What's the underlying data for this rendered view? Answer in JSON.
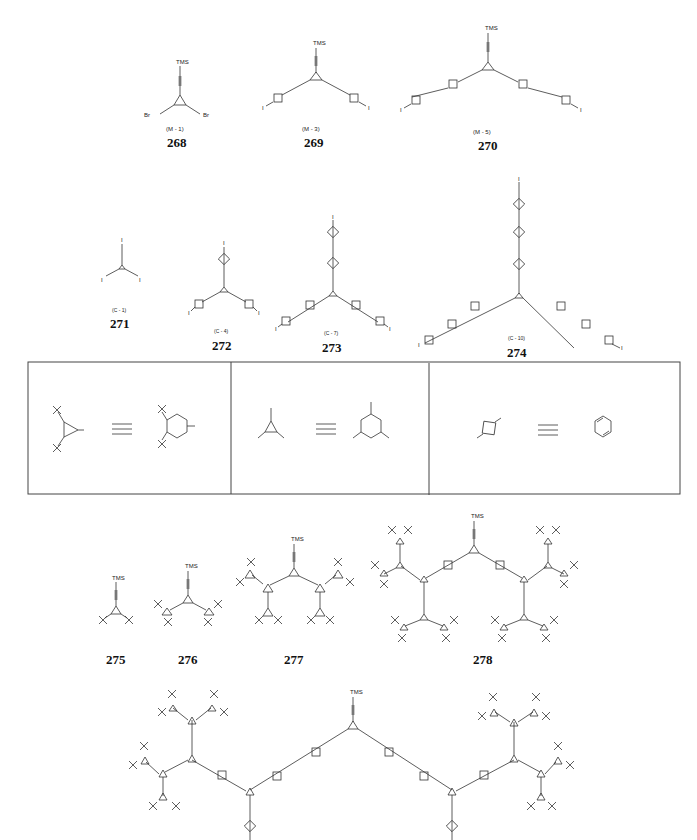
{
  "figure": {
    "row1": [
      {
        "id": "268",
        "code": "(M - 1)",
        "top_label": "TMS",
        "end_labels": [
          "Br",
          "Br"
        ]
      },
      {
        "id": "269",
        "code": "(M - 3)",
        "top_label": "TMS",
        "end_labels": [
          "I",
          "I"
        ]
      },
      {
        "id": "270",
        "code": "(M - 5)",
        "top_label": "TMS",
        "end_labels": [
          "I",
          "I"
        ]
      }
    ],
    "row2": [
      {
        "id": "271",
        "code": "(C - 1)",
        "end_labels": [
          "I",
          "I",
          "I"
        ]
      },
      {
        "id": "272",
        "code": "(C - 4)",
        "end_labels": [
          "I",
          "I",
          "I"
        ]
      },
      {
        "id": "273",
        "code": "(C - 7)",
        "end_labels": [
          "I",
          "I",
          "I"
        ]
      },
      {
        "id": "274",
        "code": "(C - 10)",
        "end_labels": [
          "I",
          "I",
          "I"
        ]
      }
    ],
    "legend": {
      "panels": [
        {
          "name": "di-tert-butyl-aryl-equivalence",
          "symbol": "≡"
        },
        {
          "name": "trisubstituted-benzene-equivalence",
          "symbol": "≡"
        },
        {
          "name": "phenylene-equivalence",
          "symbol": "≡"
        }
      ]
    },
    "row3": [
      {
        "id": "275",
        "top_label": "TMS"
      },
      {
        "id": "276",
        "top_label": "TMS"
      },
      {
        "id": "277",
        "top_label": "TMS"
      },
      {
        "id": "278",
        "top_label": "TMS"
      }
    ],
    "row4": [
      {
        "id": "279",
        "top_label": "TMS"
      }
    ]
  }
}
